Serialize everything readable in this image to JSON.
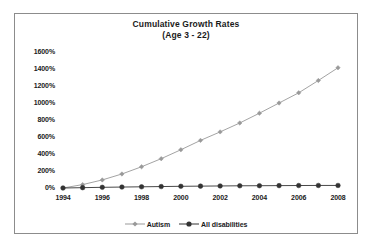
{
  "chart_data": {
    "type": "line",
    "title": "Cumulative Growth Rates",
    "subtitle": "(Age 3 - 22)",
    "xlabel": "",
    "ylabel": "",
    "grid": false,
    "legend_position": "bottom",
    "xlim": [
      1994,
      2008
    ],
    "ylim": [
      0,
      1600
    ],
    "y_tick_labels": [
      "1600%",
      "1400%",
      "1200%",
      "1000%",
      "800%",
      "600%",
      "400%",
      "200%",
      "0%"
    ],
    "y_tick_values": [
      1600,
      1400,
      1200,
      1000,
      800,
      600,
      400,
      200,
      0
    ],
    "x_tick_labels": [
      "1994",
      "1996",
      "1998",
      "2000",
      "2002",
      "2004",
      "2006",
      "2008"
    ],
    "x_tick_values": [
      1994,
      1996,
      1998,
      2000,
      2002,
      2004,
      2006,
      2008
    ],
    "x": [
      1994,
      1995,
      1996,
      1997,
      1998,
      1999,
      2000,
      2001,
      2002,
      2003,
      2004,
      2005,
      2006,
      2007,
      2008
    ],
    "series": [
      {
        "name": "Autism",
        "color": "#999999",
        "marker": "diamond",
        "values": [
          0,
          40,
          95,
          165,
          250,
          345,
          450,
          560,
          660,
          765,
          880,
          1000,
          1120,
          1265,
          1415
        ]
      },
      {
        "name": "All disabilities",
        "color": "#333333",
        "marker": "circle",
        "values": [
          0,
          4,
          8,
          11,
          14,
          17,
          20,
          22,
          24,
          26,
          27,
          28,
          29,
          30,
          30
        ]
      }
    ]
  },
  "legend": {
    "entries": [
      {
        "label": "Autism"
      },
      {
        "label": "All disabilities"
      }
    ]
  },
  "colors": {
    "autism": "#999999",
    "all_disabilities": "#333333",
    "frame_border": "#8c8c8c",
    "text": "#1a1a1a",
    "background": "#ffffff"
  }
}
